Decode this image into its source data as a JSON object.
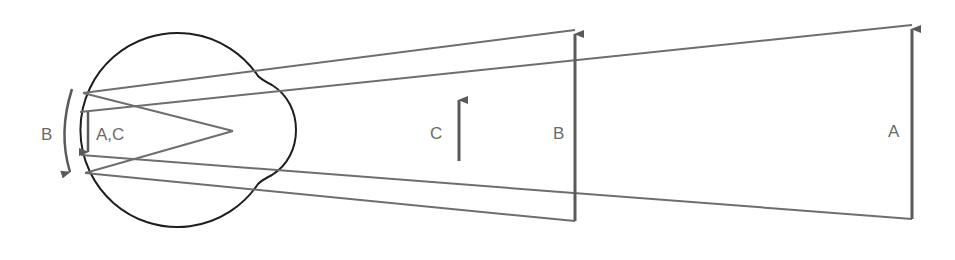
{
  "diagram": {
    "type": "visual-angle-optics",
    "colors": {
      "eye_outline": "#1e1e1e",
      "ray": "#6e6e6e",
      "arrow": "#5a5a5a",
      "label": "#6a6a6a",
      "background": "#ffffff"
    },
    "nodal_point": [
      233,
      131
    ],
    "eye": {
      "label": "eyeball",
      "retina_labels": {
        "b_label": "B",
        "ac_label": "A,C"
      }
    },
    "objects": [
      {
        "id": "C",
        "label": "C",
        "x": 459,
        "top": 96,
        "bottom": 161
      },
      {
        "id": "B",
        "label": "B",
        "x": 575,
        "top": 30,
        "bottom": 221
      },
      {
        "id": "A",
        "label": "A",
        "x": 912,
        "top": 25,
        "bottom": 219
      }
    ]
  }
}
